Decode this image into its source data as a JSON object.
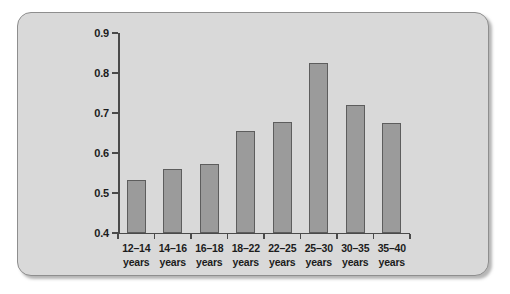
{
  "figure": {
    "panel_background": "#d9d9d9",
    "panel_border": "#8e8e8e",
    "bar_fill": "#9b9b9b",
    "bar_border": "#5d5d5d",
    "axis_color": "#4a4a4a",
    "text_color": "#1c1c1c"
  },
  "chart_data": {
    "type": "bar",
    "title": "",
    "subtitle": "",
    "xlabel": "",
    "ylabel": "",
    "categories": [
      "12–14 years",
      "14–16 years",
      "16–18 years",
      "18–22 years",
      "22–25 years",
      "25–30 years",
      "30–35 years",
      "35–40 years"
    ],
    "category_ranges": [
      "12–14",
      "14–16",
      "16–18",
      "18–22",
      "22–25",
      "25–30",
      "30–35",
      "35–40"
    ],
    "category_units": [
      "years",
      "years",
      "years",
      "years",
      "years",
      "years",
      "years",
      "years"
    ],
    "values": [
      0.533,
      0.559,
      0.573,
      0.655,
      0.678,
      0.825,
      0.72,
      0.675
    ],
    "ylim": [
      0.4,
      0.9
    ],
    "ytick_labels": [
      "0.9",
      "0.8",
      "0.7",
      "0.6",
      "0.5",
      "0.4"
    ],
    "ytick_values": [
      0.9,
      0.8,
      0.7,
      0.6,
      0.5,
      0.4
    ],
    "grid": false,
    "legend": null,
    "legend_position": "none",
    "annotations": []
  }
}
